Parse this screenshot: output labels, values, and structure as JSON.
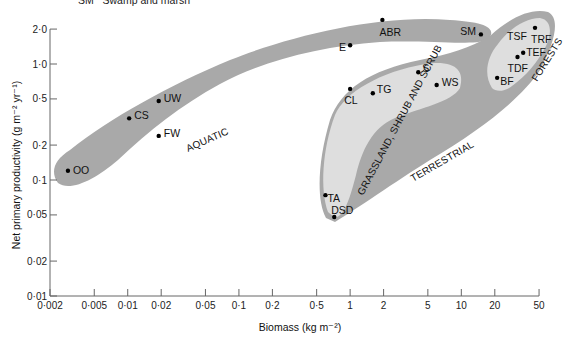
{
  "top_note": "SM   Swamp and marsh",
  "colors": {
    "outer_region": "#a9a9a9",
    "inner_region": "#dedede",
    "axis": "#666666",
    "point": "#000000"
  },
  "chart_data": {
    "type": "scatter",
    "title": "",
    "xlabel": "Biomass (kg m⁻²)",
    "ylabel": "Net primary productivity (g m⁻² yr⁻¹)",
    "xscale": "log",
    "yscale": "log",
    "xlim": [
      0.002,
      50
    ],
    "ylim": [
      0.01,
      2.0
    ],
    "grid": false,
    "x_ticks": [
      "0·002",
      "0·005",
      "0·01",
      "0·02",
      "0·05",
      "0·1",
      "0·2",
      "0·5",
      "1",
      "2",
      "5",
      "10",
      "20",
      "50"
    ],
    "x_tick_values": [
      0.002,
      0.005,
      0.01,
      0.02,
      0.05,
      0.1,
      0.2,
      0.5,
      1,
      2,
      5,
      10,
      20,
      50
    ],
    "y_ticks": [
      "2·0",
      "1·0",
      "0·5",
      "0·2",
      "0·1",
      "0·05",
      "0·02",
      "0·01"
    ],
    "y_tick_values": [
      2.0,
      1.0,
      0.5,
      0.2,
      0.1,
      0.05,
      0.02,
      0.01
    ],
    "regions": [
      {
        "name": "AQUATIC",
        "shade": "outer"
      },
      {
        "name": "TERRESTRIAL",
        "shade": "outer"
      },
      {
        "name": "GRASSLAND, SHRUB AND SCRUB",
        "shade": "inner"
      },
      {
        "name": "FORESTS",
        "shade": "inner"
      }
    ],
    "series": [
      {
        "name": "Aquatic",
        "points": [
          {
            "label": "OO",
            "x": 0.0029,
            "y": 0.12
          },
          {
            "label": "CS",
            "x": 0.0103,
            "y": 0.34
          },
          {
            "label": "UW",
            "x": 0.019,
            "y": 0.48
          },
          {
            "label": "FW",
            "x": 0.019,
            "y": 0.24
          },
          {
            "label": "E",
            "x": 1.0,
            "y": 1.45
          },
          {
            "label": "ABR",
            "x": 1.95,
            "y": 2.4
          },
          {
            "label": "SM",
            "x": 15,
            "y": 1.8
          }
        ]
      },
      {
        "name": "Grassland, shrub and scrub",
        "points": [
          {
            "label": "CL",
            "x": 1.0,
            "y": 0.61
          },
          {
            "label": "TG",
            "x": 1.6,
            "y": 0.56
          },
          {
            "label": "S",
            "x": 4.1,
            "y": 0.85
          },
          {
            "label": "WS",
            "x": 6.0,
            "y": 0.66
          },
          {
            "label": "TA",
            "x": 0.6,
            "y": 0.074
          },
          {
            "label": "DSD",
            "x": 0.72,
            "y": 0.048
          }
        ]
      },
      {
        "name": "Forests",
        "points": [
          {
            "label": "BF",
            "x": 21,
            "y": 0.76
          },
          {
            "label": "TDF",
            "x": 32,
            "y": 1.15
          },
          {
            "label": "TEF",
            "x": 36,
            "y": 1.25
          },
          {
            "label": "TRF",
            "x": 46,
            "y": 2.05
          },
          {
            "label": "TSF",
            "x": null,
            "y": null
          }
        ]
      }
    ]
  }
}
